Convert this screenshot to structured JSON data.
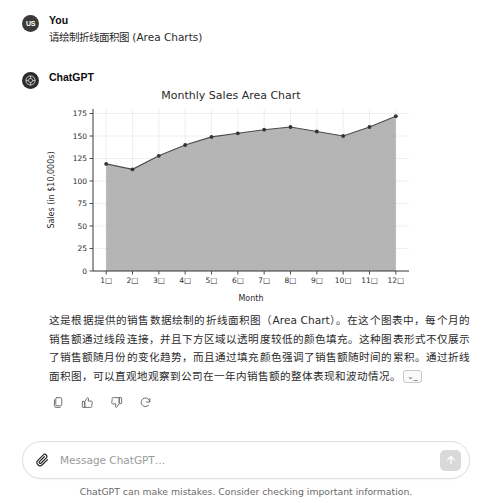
{
  "messages": [
    {
      "role": "user",
      "avatar_initials": "US",
      "author": "You",
      "text": "请绘制折线面积图 (Area Charts)"
    },
    {
      "role": "assistant",
      "author": "ChatGPT",
      "paragraph_1": "这是根据提供的销售数据绘制的折线面积图（Area Chart）。在这个图表中，每个月的销售额通过线段连接，并且下方区域以透明度较低的颜色填充。这种图表形式不仅展示了销售额随月份的变化趋势，而且通过填充颜色强调了销售额随时间的累积。通过折线面积图，可以直观地观察到公司在一年内销售额的整体表现和波动情况。",
      "citation_chip": "⌄_"
    }
  ],
  "chart_data": {
    "type": "area",
    "title": "Monthly Sales Area Chart",
    "xlabel": "Month",
    "ylabel": "Sales (in $10,000s)",
    "categories": [
      "1月",
      "2月",
      "3月",
      "4月",
      "5月",
      "6月",
      "7月",
      "8月",
      "9月",
      "10月",
      "11月",
      "12月"
    ],
    "tick_labels_rendered": [
      "1□",
      "2□",
      "3□",
      "4□",
      "5□",
      "6□",
      "7□",
      "8□",
      "9□",
      "10□",
      "11□",
      "12□"
    ],
    "values": [
      119,
      113,
      128,
      140,
      149,
      153,
      157,
      160,
      155,
      150,
      160,
      172
    ],
    "ylim": [
      0,
      180
    ],
    "yticks": [
      0,
      25,
      50,
      75,
      100,
      125,
      150,
      175
    ],
    "grid": true,
    "legend": "none",
    "line_color": "#4b4b4b",
    "fill_color": "#a8a8a8",
    "marker": "dot"
  },
  "actions": {
    "copy_label": "copy",
    "thumbs_up_label": "good response",
    "thumbs_down_label": "bad response",
    "regenerate_label": "regenerate"
  },
  "composer": {
    "placeholder": "Message ChatGPT…",
    "value": "",
    "attach_label": "attach file",
    "send_label": "send"
  },
  "disclaimer": "ChatGPT can make mistakes. Consider checking important information.",
  "colors": {
    "text": "#2b2b2b",
    "muted": "#6b6b6b",
    "border": "#dedede",
    "chart_fill": "#a8a8a8"
  }
}
